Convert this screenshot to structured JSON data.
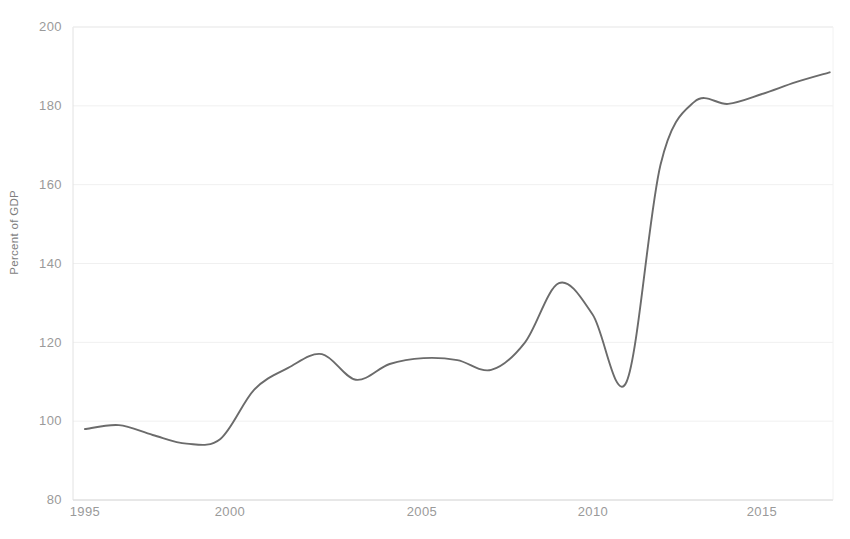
{
  "chart_data": {
    "type": "line",
    "title": "",
    "xlabel": "",
    "ylabel": "Percent of GDP",
    "xlim": [
      1994.65,
      1996.65
    ],
    "ylim": [
      80,
      200
    ],
    "yticks": [
      80,
      100,
      120,
      140,
      160,
      180,
      200
    ],
    "ytick_labels": [
      "80",
      "100",
      "120",
      "140",
      "160",
      "180",
      "200"
    ],
    "xticks": [
      1995,
      2000,
      2005,
      2010,
      2015
    ],
    "xtick_labels": [
      "1995",
      "2000",
      "2005",
      "2010",
      "2015"
    ],
    "grid": "horizontal",
    "legend": "none",
    "series": [
      {
        "name": "Percent of GDP",
        "color": "#6b6b6b",
        "x": [
          1995,
          1996,
          1997,
          1998,
          1999,
          2000,
          2001,
          2002,
          2003,
          2004,
          2005,
          2006,
          2007,
          2008,
          2009,
          2010,
          2011,
          2012,
          2013,
          2014,
          2015,
          2016,
          2017
        ],
        "values": [
          98,
          99,
          96.5,
          94.3,
          95.5,
          108,
          113.5,
          117,
          110.5,
          114.5,
          116,
          115.5,
          113,
          120,
          135,
          127,
          110,
          165,
          181,
          180.5,
          183,
          186,
          188.5
        ]
      }
    ]
  },
  "axis": {
    "ylabel_text": "Percent of GDP",
    "ytick_0": "200",
    "ytick_1": "180",
    "ytick_2": "160",
    "ytick_3": "140",
    "ytick_4": "120",
    "ytick_5": "100",
    "ytick_6": "80",
    "xtick_0": "1995",
    "xtick_1": "2000",
    "xtick_2": "2005",
    "xtick_3": "2010",
    "xtick_4": "2015"
  },
  "colors": {
    "line": "#6b6b6b",
    "grid": "#f0f0f0",
    "axis_text": "#9a9a9a",
    "plot_border": "#e8e8e8",
    "background": "#ffffff"
  },
  "title": {
    "text": ""
  }
}
